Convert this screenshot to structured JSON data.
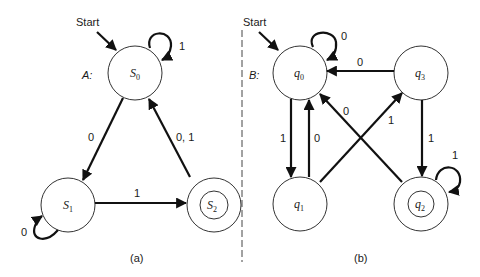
{
  "figure": {
    "panels": [
      {
        "id": "a",
        "caption": "(a)",
        "automaton_label": "A:",
        "start_label": "Start",
        "states": [
          {
            "id": "S0",
            "name": "S",
            "sub": "0",
            "accepting": false,
            "start": true
          },
          {
            "id": "S1",
            "name": "S",
            "sub": "1",
            "accepting": false,
            "start": false
          },
          {
            "id": "S2",
            "name": "S",
            "sub": "2",
            "accepting": true,
            "start": false
          }
        ],
        "transitions": [
          {
            "from": "S0",
            "to": "S0",
            "label": "1"
          },
          {
            "from": "S0",
            "to": "S1",
            "label": "0"
          },
          {
            "from": "S1",
            "to": "S1",
            "label": "0"
          },
          {
            "from": "S1",
            "to": "S2",
            "label": "1"
          },
          {
            "from": "S2",
            "to": "S0",
            "label": "0, 1"
          }
        ]
      },
      {
        "id": "b",
        "caption": "(b)",
        "automaton_label": "B:",
        "start_label": "Start",
        "states": [
          {
            "id": "q0",
            "name": "q",
            "sub": "0",
            "accepting": false,
            "start": true
          },
          {
            "id": "q1",
            "name": "q",
            "sub": "1",
            "accepting": false,
            "start": false
          },
          {
            "id": "q2",
            "name": "q",
            "sub": "2",
            "accepting": true,
            "start": false
          },
          {
            "id": "q3",
            "name": "q",
            "sub": "3",
            "accepting": false,
            "start": false
          }
        ],
        "transitions": [
          {
            "from": "q0",
            "to": "q0",
            "label": "0"
          },
          {
            "from": "q3",
            "to": "q0",
            "label": "0"
          },
          {
            "from": "q0",
            "to": "q1",
            "label": "1"
          },
          {
            "from": "q1",
            "to": "q0",
            "label": "0"
          },
          {
            "from": "q1",
            "to": "q3",
            "label": "1"
          },
          {
            "from": "q2",
            "to": "q0",
            "label": "0"
          },
          {
            "from": "q3",
            "to": "q2",
            "label": "1"
          },
          {
            "from": "q2",
            "to": "q2",
            "label": "1"
          }
        ]
      }
    ]
  }
}
